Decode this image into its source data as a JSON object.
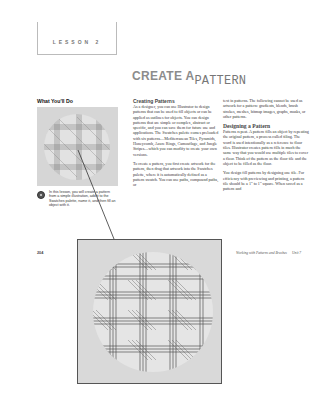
{
  "lesson": {
    "label": "LESSON 2"
  },
  "title": {
    "part1": "CREATE A",
    "part2": "PATTERN"
  },
  "what_youll_do": {
    "heading": "What You'll Do",
    "caption": "In this lesson, you will create a pattern from a simple illustration, add it to the Swatches palette, name it, and then fill an object with it."
  },
  "creating_patterns": {
    "heading": "Creating Patterns",
    "p1": "As a designer, you can use Illustrator to design patterns that can be used to fill objects or can be applied as outlines for objects. You can design patterns that are simple or complex, abstract or specific, and you can save them for future use and applications. The Swatches palette comes preloaded with six patterns—Mediterranean Tiles, Pyramids, Honeycomb, Azure Rings, Camouflage, and Jungle Stripes—which you can modify to create your own versions.",
    "p2": "To create a pattern, you first create artwork for the pattern, then drag that artwork into the Swatches palette, where it is automatically defined as a pattern swatch. You can use paths, compound paths, or"
  },
  "column3": {
    "p1": "text in patterns. The following cannot be used as artwork for a pattern: gradients, blends, brush strokes, meshes, bitmap images, graphs, masks, or other patterns.",
    "heading": "Designing a Pattern",
    "p2": "Patterns repeat. A pattern fills an object by repeating the original pattern, a process called tiling. The word is used intentionally as a reference to floor tiles. Illustrator creates pattern fills in much the same way that you would use multiple tiles to cover a floor. Think of the pattern as the floor tile and the object to be filled as the floor.",
    "p3": "You design fill patterns by designing one tile. For efficiency with previewing and printing, a pattern tile should be a 1\" to 1\" square. When saved as a pattern and"
  },
  "footer": {
    "page_number": "204",
    "running_title": "Working with Patterns and Brushes",
    "unit": "Unit 7"
  },
  "colors": {
    "title_gray": "#8c8c8c",
    "plaid_line": "#555555",
    "image_bg": "#d9d9d9",
    "circle_bg": "#e4e4e4"
  },
  "icons": {
    "caption_bullet": "target-bullet-icon"
  }
}
